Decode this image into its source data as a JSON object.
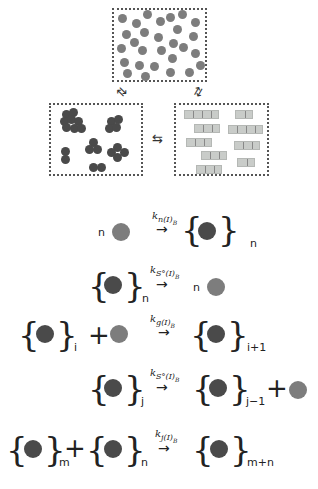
{
  "diagram": {
    "top_box_label": "monomers",
    "left_box_label": "amorphous-aggregates",
    "right_box_label": "ordered-fibrils",
    "equilibrium_symbol": "⇆",
    "colors": {
      "monomer": "#7d7d7d",
      "aggregate": "#4a4a4a",
      "fibril": "#c9ccc9"
    }
  },
  "equations": [
    {
      "lhs_coef": "n",
      "rate": "k",
      "rate_sub": "n(I)",
      "rate_subsub": "B",
      "arrow": "→",
      "rhs_sub": "n"
    },
    {
      "lhs_sub": "n",
      "rate": "k",
      "rate_sub": "S°(I)",
      "rate_subsub": "B",
      "arrow": "→",
      "rhs_coef": "n"
    },
    {
      "lhs_sub": "i",
      "plus": "+",
      "rate": "k",
      "rate_sub": "g(I)",
      "rate_subsub": "B",
      "arrow": "→",
      "rhs_sub": "i+1"
    },
    {
      "lhs_sub": "j",
      "rate": "k",
      "rate_sub": "S°(I)",
      "rate_subsub": "B",
      "arrow": "→",
      "rhs_sub": "j−1",
      "plus": "+"
    },
    {
      "lhs_sub1": "m",
      "plus": "+",
      "lhs_sub2": "n",
      "rate": "k",
      "rate_sub": "j(I)",
      "rate_subsub": "B",
      "arrow": "→",
      "rhs_sub": "m+n"
    }
  ]
}
